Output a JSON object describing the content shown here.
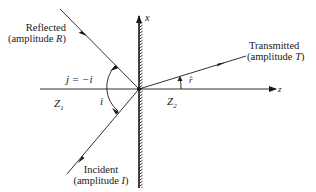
{
  "diagram": {
    "type": "wave reflection and transmission at a boundary",
    "axes": {
      "x_label": "x",
      "z_label": "z"
    },
    "media": {
      "left": "Z",
      "left_sub": "1",
      "right": "Z",
      "right_sub": "2"
    },
    "rays": {
      "reflected": {
        "line1": "Reflected",
        "line2_prefix": "(amplitude ",
        "line2_var": "R",
        "line2_suffix": ")"
      },
      "transmitted": {
        "line1": "Transmitted",
        "line2_prefix": "(amplitude ",
        "line2_var": "T",
        "line2_suffix": ")"
      },
      "incident": {
        "line1": "Incident",
        "line2_prefix": "(amplitude ",
        "line2_var": "I",
        "line2_suffix": ")"
      }
    },
    "angles": {
      "reflection": "j = −i",
      "incidence": "i",
      "refraction": "r̂"
    },
    "colors": {
      "ink": "#1a1a1a",
      "background": "#ffffff"
    }
  }
}
